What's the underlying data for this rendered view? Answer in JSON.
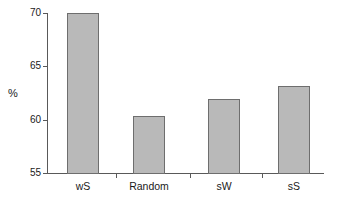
{
  "chart_data": {
    "type": "bar",
    "title": "",
    "xlabel": "",
    "ylabel": "%",
    "categories": [
      "wS",
      "Random",
      "sW",
      "sS"
    ],
    "values": [
      70.0,
      60.3,
      61.9,
      63.2
    ],
    "ylim": [
      55,
      70
    ],
    "yticks": [
      55,
      60,
      65,
      70
    ],
    "ytick_labels": [
      "55",
      "60",
      "65",
      "70"
    ],
    "grid": false,
    "legend": null,
    "bar_color": "#b9b9b9",
    "bar_edge_color": "#6e6e6e",
    "axis_color": "#595959",
    "text_color": "#1a1a1a"
  }
}
